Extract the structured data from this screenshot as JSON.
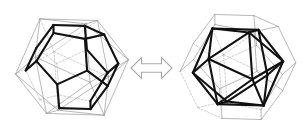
{
  "figure": {
    "title": "Dual pair of Platonic solids",
    "caption": "",
    "background_color": "#ffffff",
    "width": 303,
    "height": 135,
    "relation_symbol": "↔",
    "relation_name": "duality-arrow"
  },
  "styles": {
    "bold_stroke_color": "#111111",
    "bold_stroke_width": 2.1,
    "thin_stroke_color": "#9a9a9a",
    "thin_stroke_width": 0.7,
    "hidden_stroke_color": "#b0b0b0",
    "hidden_stroke_width": 0.6,
    "hidden_dash": "2,1.6",
    "arrow_stroke_color": "#a8a8a8",
    "arrow_fill_color": "#ffffff",
    "arrow_stroke_width": 1.1
  },
  "left_figure": {
    "name": "dodecahedron-in-icosahedron",
    "emphasized_solid": "dodecahedron",
    "outer_solid": "icosahedron",
    "center": {
      "x": 72,
      "y": 67
    },
    "radius": 58,
    "rotation": {
      "yaw": 20,
      "pitch": -16,
      "roll": 4
    },
    "vertex_count_emphasized": 20,
    "edge_count_emphasized": 30,
    "face_count_emphasized": 12,
    "vertex_count_outer": 12,
    "edge_count_outer": 30,
    "face_count_outer": 20
  },
  "right_figure": {
    "name": "icosahedron-in-dodecahedron",
    "emphasized_solid": "icosahedron",
    "outer_solid": "dodecahedron",
    "center": {
      "x": 238,
      "y": 67
    },
    "radius": 58,
    "rotation": {
      "yaw": 20,
      "pitch": -16,
      "roll": 4
    },
    "vertex_count_emphasized": 12,
    "edge_count_emphasized": 30,
    "face_count_emphasized": 20,
    "vertex_count_outer": 20,
    "edge_count_outer": 30,
    "face_count_outer": 12
  },
  "arrow": {
    "name": "double-headed-arrow",
    "x": 131,
    "y": 68,
    "length": 41,
    "shaft_half_height": 4.2,
    "head_half_height": 10.5,
    "head_length": 10.5
  }
}
